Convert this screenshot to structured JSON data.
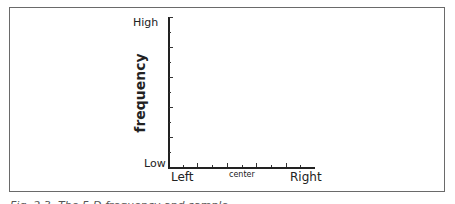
{
  "chart_data": {
    "type": "line",
    "title": "",
    "xlabel": "",
    "ylabel": "frequency",
    "x_tick_labels": [
      "Left",
      "center",
      "Right"
    ],
    "y_tick_labels": [
      "Low",
      "High"
    ],
    "series": [],
    "grid": false,
    "x_major_ticks": 5,
    "y_major_ticks": 5,
    "minor_ticks": true
  },
  "axes": {
    "ylabel": "frequency",
    "y_high": "High",
    "y_low": "Low",
    "x_left": "Left",
    "x_center": "center",
    "x_right": "Right"
  },
  "caption": "Fig. 2.3: The 5-D frequency and sample"
}
